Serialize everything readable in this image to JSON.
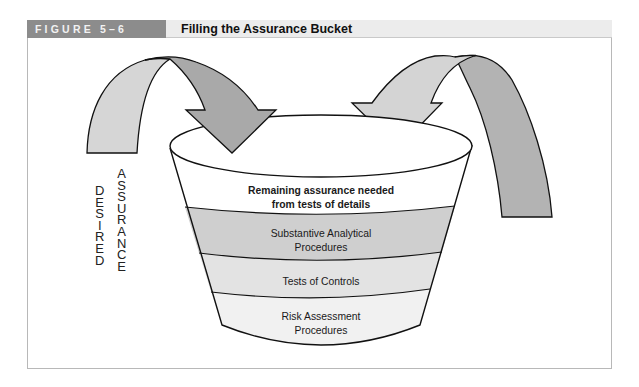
{
  "figure": {
    "label": "FIGURE 5–6",
    "title": "Filling the Assurance Bucket"
  },
  "side_label": {
    "word1": "DESIRED",
    "word2": "ASSURANCE",
    "word1_letters": [
      "D",
      "E",
      "S",
      "I",
      "R",
      "E",
      "D"
    ],
    "word2_letters": [
      "A",
      "S",
      "S",
      "U",
      "R",
      "A",
      "N",
      "C",
      "E"
    ]
  },
  "bucket": {
    "layers": [
      {
        "line1": "Remaining assurance needed",
        "line2": "from tests of details",
        "fill": "#ffffff",
        "bold": true
      },
      {
        "line1": "Substantive Analytical",
        "line2": "Procedures",
        "fill": "#cfcfcf",
        "bold": false
      },
      {
        "line1": "Tests of Controls",
        "line2": "",
        "fill": "#e3e3e3",
        "bold": false
      },
      {
        "line1": "Risk Assessment",
        "line2": "Procedures",
        "fill": "#f1f1f1",
        "bold": false
      }
    ]
  },
  "arrows": [
    {
      "name": "left-arrow",
      "direction": "down-right",
      "tail_fill": "#d6d6d6",
      "head_fill": "#a9a9a9"
    },
    {
      "name": "right-arrow",
      "direction": "down-left",
      "tail_fill": "#b3b3b3",
      "head_fill": "#d4d4d4"
    }
  ],
  "colors": {
    "header_label_bg": "#8c8c8c",
    "header_title_bg": "#ececec",
    "outline": "#111111",
    "frame": "#b8b8b8"
  }
}
